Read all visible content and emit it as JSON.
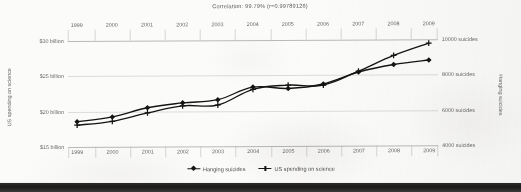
{
  "chart_data": {
    "type": "line",
    "title": "Correlation: 99.79% (r=0.99789126)",
    "x": [
      1999,
      2000,
      2001,
      2002,
      2003,
      2004,
      2005,
      2006,
      2007,
      2008,
      2009
    ],
    "xlabel": "",
    "grid": true,
    "legend_position": "bottom",
    "axes": {
      "x_top": {
        "ticks": [
          "1999",
          "2000",
          "2001",
          "2002",
          "2003",
          "2004",
          "2005",
          "2006",
          "2007",
          "2008",
          "2009"
        ]
      },
      "x_bottom": {
        "ticks": [
          "1999",
          "2000",
          "2001",
          "2002",
          "2003",
          "2004",
          "2005",
          "2006",
          "2007",
          "2008",
          "2009"
        ]
      },
      "y_left": {
        "title": "US spending on science",
        "ticks": [
          "$30 billion",
          "$25 billion",
          "$20 billion",
          "$15 billion"
        ],
        "tick_values": [
          30,
          25,
          20,
          15
        ],
        "ylim": [
          15,
          30
        ]
      },
      "y_right": {
        "title": "Hanging suicides",
        "ticks": [
          "10000 suicides",
          "8000 suicides",
          "6000 suicides",
          "4000 suicides"
        ],
        "tick_values": [
          10000,
          8000,
          6000,
          4000
        ],
        "ylim": [
          4000,
          10000
        ]
      }
    },
    "series": [
      {
        "name": "Hanging suicides",
        "axis": "right",
        "marker": "diamond",
        "color": "#141414",
        "values": [
          5427,
          5688,
          6198,
          6462,
          6635,
          7336,
          7248,
          7491,
          8161,
          8578,
          8821
        ]
      },
      {
        "name": "US spending on science",
        "axis": "left",
        "marker": "plus",
        "color": "#141414",
        "values": [
          18.079,
          18.594,
          19.753,
          20.734,
          20.831,
          23.029,
          23.597,
          23.584,
          25.525,
          27.731,
          29.449
        ]
      }
    ],
    "legend": [
      {
        "label": "Hanging suicides",
        "marker": "diamond"
      },
      {
        "label": "US spending on science",
        "marker": "plus"
      }
    ]
  }
}
